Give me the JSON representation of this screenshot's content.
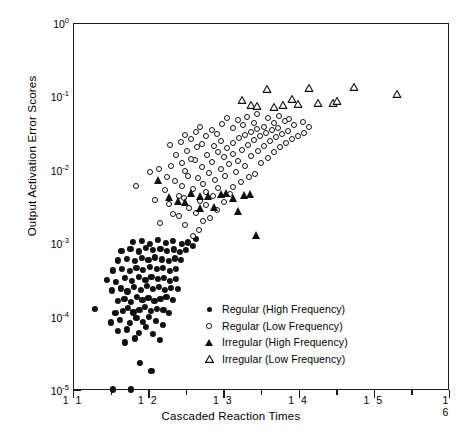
{
  "chart_data": {
    "type": "scatter",
    "title": "",
    "xlabel": "Cascaded Reaction Times",
    "ylabel": "Output Activation Error Scores",
    "xlim": [
      1.1,
      1.6
    ],
    "ylim": [
      1e-05,
      1
    ],
    "yscale": "log",
    "xscale": "linear",
    "grid": false,
    "legend_position": "inside-lower-right",
    "xticks": [
      1.1,
      1.2,
      1.3,
      1.4,
      1.5,
      1.6
    ],
    "xtick_labels": [
      "1 1",
      "1 2",
      "1 3",
      "1 4",
      "1 5",
      "1 6"
    ],
    "yticks": [
      1e-05,
      0.0001,
      0.001,
      0.01,
      0.1,
      1
    ],
    "ytick_labels": [
      "10-5",
      "10-4",
      "10-3",
      "10-2",
      "10-1",
      "100"
    ],
    "ytick_mantissa": "10",
    "ytick_exponents": [
      "-5",
      "-4",
      "-3",
      "-2",
      "-1",
      "0"
    ],
    "series": [
      {
        "name": "Regular (High Frequency)",
        "marker": "filled-circle",
        "color": "#111111",
        "points": [
          [
            1.152,
            1.05e-05
          ],
          [
            1.176,
            1.05e-05
          ],
          [
            1.188,
            2.4e-05
          ],
          [
            1.203,
            1.9e-05
          ],
          [
            1.168,
            4.6e-05
          ],
          [
            1.181,
            5.2e-05
          ],
          [
            1.158,
            6.6e-05
          ],
          [
            1.17,
            6.9e-05
          ],
          [
            1.186,
            6.2e-05
          ],
          [
            1.196,
            7.4e-05
          ],
          [
            1.205,
            6e-05
          ],
          [
            1.214,
            5e-05
          ],
          [
            1.149,
            8.6e-05
          ],
          [
            1.161,
            9.2e-05
          ],
          [
            1.174,
            8.4e-05
          ],
          [
            1.183,
            9.8e-05
          ],
          [
            1.192,
            8.8e-05
          ],
          [
            1.2,
            0.000102
          ],
          [
            1.209,
            9e-05
          ],
          [
            1.218,
            8e-05
          ],
          [
            1.128,
            0.00013
          ],
          [
            1.155,
            0.000115
          ],
          [
            1.165,
            0.000124
          ],
          [
            1.172,
            0.000134
          ],
          [
            1.179,
            0.000118
          ],
          [
            1.187,
            0.000128
          ],
          [
            1.194,
            0.00014
          ],
          [
            1.202,
            0.000122
          ],
          [
            1.21,
            0.000132
          ],
          [
            1.219,
            0.000126
          ],
          [
            1.226,
            0.000116
          ],
          [
            1.158,
            0.00017
          ],
          [
            1.167,
            0.000182
          ],
          [
            1.176,
            0.000164
          ],
          [
            1.184,
            0.00019
          ],
          [
            1.191,
            0.000172
          ],
          [
            1.199,
            0.000186
          ],
          [
            1.207,
            0.000168
          ],
          [
            1.215,
            0.000178
          ],
          [
            1.223,
            0.000192
          ],
          [
            1.231,
            0.000174
          ],
          [
            1.15,
            0.000235
          ],
          [
            1.162,
            0.00025
          ],
          [
            1.171,
            0.000228
          ],
          [
            1.18,
            0.00026
          ],
          [
            1.189,
            0.00024
          ],
          [
            1.197,
            0.000272
          ],
          [
            1.205,
            0.000246
          ],
          [
            1.213,
            0.000262
          ],
          [
            1.221,
            0.000238
          ],
          [
            1.229,
            0.000254
          ],
          [
            1.238,
            0.000244
          ],
          [
            1.144,
            0.00033
          ],
          [
            1.156,
            0.00031
          ],
          [
            1.168,
            0.000345
          ],
          [
            1.177,
            0.00032
          ],
          [
            1.186,
            0.000355
          ],
          [
            1.195,
            0.000328
          ],
          [
            1.203,
            0.00036
          ],
          [
            1.212,
            0.000335
          ],
          [
            1.22,
            0.000348
          ],
          [
            1.228,
            0.000318
          ],
          [
            1.236,
            0.00034
          ],
          [
            1.152,
            0.00044
          ],
          [
            1.164,
            0.00046
          ],
          [
            1.174,
            0.00043
          ],
          [
            1.183,
            0.000475
          ],
          [
            1.192,
            0.000445
          ],
          [
            1.201,
            0.000485
          ],
          [
            1.21,
            0.000455
          ],
          [
            1.218,
            0.00047
          ],
          [
            1.227,
            0.000438
          ],
          [
            1.235,
            0.000462
          ],
          [
            1.158,
            0.0006
          ],
          [
            1.17,
            0.00063
          ],
          [
            1.181,
            0.000585
          ],
          [
            1.19,
            0.00065
          ],
          [
            1.199,
            0.00061
          ],
          [
            1.208,
            0.00066
          ],
          [
            1.217,
            0.00062
          ],
          [
            1.226,
            0.000595
          ],
          [
            1.234,
            0.00064
          ],
          [
            1.242,
            0.000605
          ],
          [
            1.163,
            0.00082
          ],
          [
            1.175,
            0.00086
          ],
          [
            1.186,
            0.0008
          ],
          [
            1.196,
            0.00088
          ],
          [
            1.205,
            0.00083
          ],
          [
            1.215,
            0.00087
          ],
          [
            1.224,
            0.00081
          ],
          [
            1.233,
            0.00085
          ],
          [
            1.241,
            0.00079
          ],
          [
            1.249,
            0.00084
          ],
          [
            1.178,
            0.00108
          ],
          [
            1.19,
            0.00112
          ],
          [
            1.201,
            0.00102
          ],
          [
            1.212,
            0.00115
          ],
          [
            1.222,
            0.00105
          ],
          [
            1.232,
            0.0011
          ],
          [
            1.243,
            0.001
          ],
          [
            1.252,
            0.00106
          ],
          [
            1.258,
            0.00094
          ],
          [
            1.262,
            0.00118
          ]
        ]
      },
      {
        "name": "Regular (Low Frequency)",
        "marker": "open-circle",
        "color": "#111111",
        "points": [
          [
            1.258,
            0.0013
          ],
          [
            1.266,
            0.00155
          ],
          [
            1.248,
            0.0018
          ],
          [
            1.272,
            0.0021
          ],
          [
            1.24,
            0.00245
          ],
          [
            1.262,
            0.0027
          ],
          [
            1.281,
            0.0023
          ],
          [
            1.253,
            0.0031
          ],
          [
            1.275,
            0.0034
          ],
          [
            1.29,
            0.0029
          ],
          [
            1.268,
            0.00385
          ],
          [
            1.246,
            0.0042
          ],
          [
            1.285,
            0.0045
          ],
          [
            1.299,
            0.0037
          ],
          [
            1.276,
            0.0051
          ],
          [
            1.258,
            0.0056
          ],
          [
            1.307,
            0.0048
          ],
          [
            1.292,
            0.0059
          ],
          [
            1.224,
            0.0082
          ],
          [
            1.183,
            0.0062
          ],
          [
            1.271,
            0.0066
          ],
          [
            1.312,
            0.0061
          ],
          [
            1.288,
            0.0074
          ],
          [
            1.265,
            0.0079
          ],
          [
            1.322,
            0.0071
          ],
          [
            1.301,
            0.0086
          ],
          [
            1.28,
            0.0093
          ],
          [
            1.333,
            0.0082
          ],
          [
            1.248,
            0.0098
          ],
          [
            1.295,
            0.0105
          ],
          [
            1.316,
            0.0096
          ],
          [
            1.27,
            0.0112
          ],
          [
            1.341,
            0.0091
          ],
          [
            1.306,
            0.0122
          ],
          [
            1.284,
            0.0132
          ],
          [
            1.327,
            0.0115
          ],
          [
            1.261,
            0.0142
          ],
          [
            1.299,
            0.0152
          ],
          [
            1.318,
            0.0138
          ],
          [
            1.349,
            0.0128
          ],
          [
            1.277,
            0.0162
          ],
          [
            1.311,
            0.0172
          ],
          [
            1.336,
            0.0158
          ],
          [
            1.292,
            0.0182
          ],
          [
            1.358,
            0.0148
          ],
          [
            1.323,
            0.0192
          ],
          [
            1.304,
            0.0205
          ],
          [
            1.345,
            0.0185
          ],
          [
            1.286,
            0.0218
          ],
          [
            1.366,
            0.0178
          ],
          [
            1.331,
            0.0228
          ],
          [
            1.312,
            0.0242
          ],
          [
            1.353,
            0.0215
          ],
          [
            1.296,
            0.0255
          ],
          [
            1.374,
            0.0208
          ],
          [
            1.339,
            0.0265
          ],
          [
            1.32,
            0.028
          ],
          [
            1.361,
            0.0252
          ],
          [
            1.382,
            0.0238
          ],
          [
            1.347,
            0.0295
          ],
          [
            1.328,
            0.031
          ],
          [
            1.369,
            0.0288
          ],
          [
            1.39,
            0.0272
          ],
          [
            1.355,
            0.0325
          ],
          [
            1.336,
            0.0342
          ],
          [
            1.377,
            0.0315
          ],
          [
            1.398,
            0.0302
          ],
          [
            1.363,
            0.0355
          ],
          [
            1.344,
            0.0372
          ],
          [
            1.385,
            0.0348
          ],
          [
            1.406,
            0.033
          ],
          [
            1.371,
            0.0388
          ],
          [
            1.215,
            0.00195
          ],
          [
            1.232,
            0.0026
          ],
          [
            1.226,
            0.0035
          ],
          [
            1.239,
            0.0046
          ],
          [
            1.208,
            0.004
          ],
          [
            1.221,
            0.0054
          ],
          [
            1.244,
            0.0063
          ],
          [
            1.234,
            0.0072
          ],
          [
            1.252,
            0.0084
          ],
          [
            1.201,
            0.0095
          ],
          [
            1.213,
            0.0106
          ],
          [
            1.229,
            0.0118
          ],
          [
            1.243,
            0.0126
          ],
          [
            1.256,
            0.0146
          ],
          [
            1.236,
            0.0166
          ],
          [
            1.25,
            0.0188
          ],
          [
            1.264,
            0.0212
          ],
          [
            1.228,
            0.0222
          ],
          [
            1.242,
            0.0248
          ],
          [
            1.256,
            0.0272
          ],
          [
            1.27,
            0.0235
          ],
          [
            1.248,
            0.0305
          ],
          [
            1.262,
            0.0335
          ],
          [
            1.276,
            0.0295
          ],
          [
            1.283,
            0.036
          ],
          [
            1.29,
            0.032
          ],
          [
            1.268,
            0.0395
          ],
          [
            1.297,
            0.043
          ],
          [
            1.311,
            0.038
          ],
          [
            1.325,
            0.0415
          ],
          [
            1.339,
            0.0455
          ],
          [
            1.352,
            0.04
          ],
          [
            1.366,
            0.0442
          ],
          [
            1.38,
            0.0475
          ],
          [
            1.393,
            0.042
          ],
          [
            1.404,
            0.046
          ],
          [
            1.412,
            0.039
          ],
          [
            1.358,
            0.052
          ],
          [
            1.372,
            0.056
          ],
          [
            1.386,
            0.05
          ],
          [
            1.33,
            0.054
          ],
          [
            1.344,
            0.0585
          ],
          [
            1.318,
            0.049
          ],
          [
            1.304,
            0.053
          ]
        ]
      },
      {
        "name": "Irregular (High Frequency)",
        "marker": "filled-triangle",
        "color": "#111111",
        "points": [
          [
            1.212,
            0.0074
          ],
          [
            1.226,
            0.0044
          ],
          [
            1.238,
            0.00385
          ],
          [
            1.256,
            0.005
          ],
          [
            1.268,
            0.00455
          ],
          [
            1.278,
            0.0045
          ],
          [
            1.286,
            0.0032
          ],
          [
            1.296,
            0.00485
          ],
          [
            1.302,
            0.00505
          ],
          [
            1.312,
            0.0043
          ],
          [
            1.318,
            0.00285
          ],
          [
            1.326,
            0.0047
          ],
          [
            1.334,
            0.0049
          ],
          [
            1.342,
            0.00135
          ],
          [
            1.268,
            0.0031
          ],
          [
            1.248,
            0.0037
          ]
        ]
      },
      {
        "name": "Irregular (Low Frequency)",
        "marker": "open-triangle",
        "color": "#111111",
        "points": [
          [
            1.323,
            0.092
          ],
          [
            1.336,
            0.078
          ],
          [
            1.344,
            0.076
          ],
          [
            1.356,
            0.132
          ],
          [
            1.366,
            0.074
          ],
          [
            1.378,
            0.079
          ],
          [
            1.39,
            0.096
          ],
          [
            1.398,
            0.081
          ],
          [
            1.412,
            0.136
          ],
          [
            1.424,
            0.083
          ],
          [
            1.444,
            0.084
          ],
          [
            1.45,
            0.09
          ],
          [
            1.472,
            0.14
          ],
          [
            1.53,
            0.11
          ]
        ]
      }
    ]
  },
  "legend": {
    "entries": [
      {
        "label": "Regular (High Frequency)",
        "marker": "filled-circle"
      },
      {
        "label": "Regular (Low Frequency)",
        "marker": "open-circle"
      },
      {
        "label": "Irregular (High Frequency)",
        "marker": "filled-triangle"
      },
      {
        "label": "Irregular (Low Frequency)",
        "marker": "open-triangle"
      }
    ]
  }
}
